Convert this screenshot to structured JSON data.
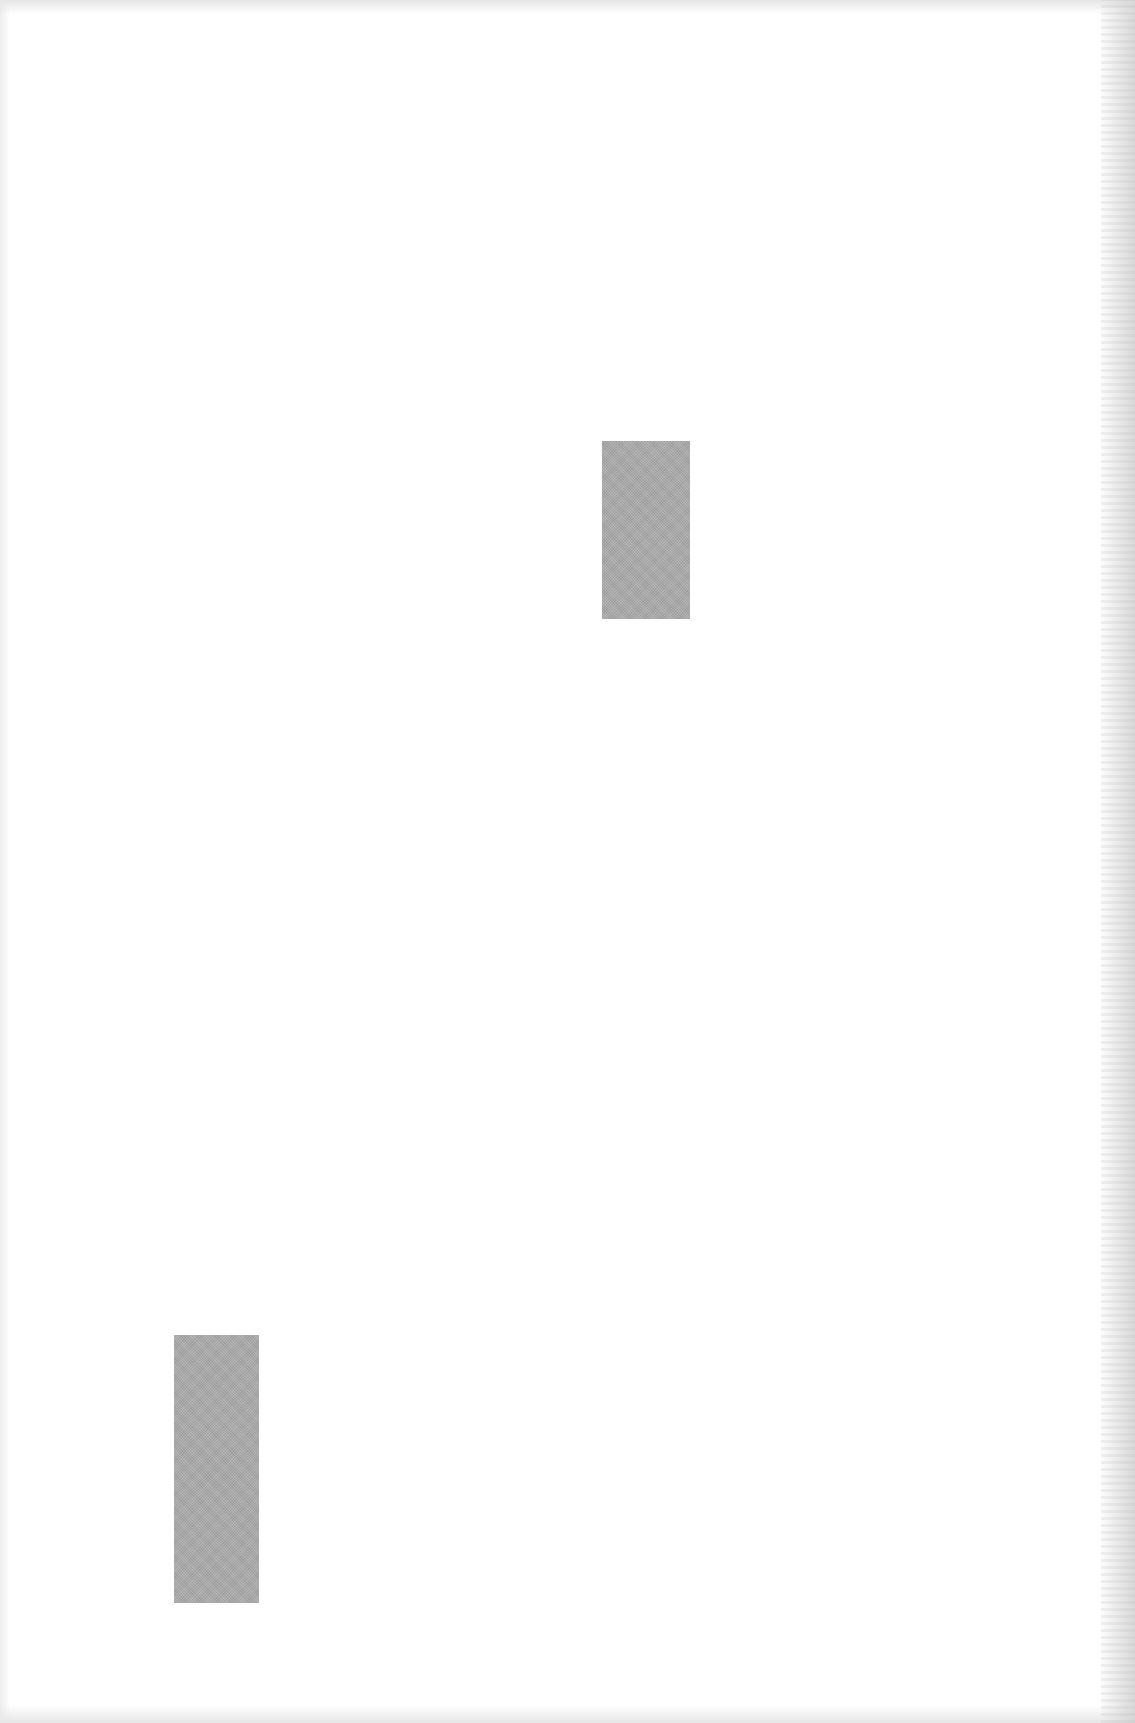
{
  "page": {
    "width": 1135,
    "height": 1723,
    "background": "#ffffff"
  },
  "blocks": [
    {
      "name": "gray-block-upper",
      "x": 602,
      "y": 441,
      "width": 88,
      "height": 178,
      "color": "#aaaaaa"
    },
    {
      "name": "gray-block-lower",
      "x": 174,
      "y": 1335,
      "width": 85,
      "height": 268,
      "color": "#aaaaaa"
    }
  ]
}
